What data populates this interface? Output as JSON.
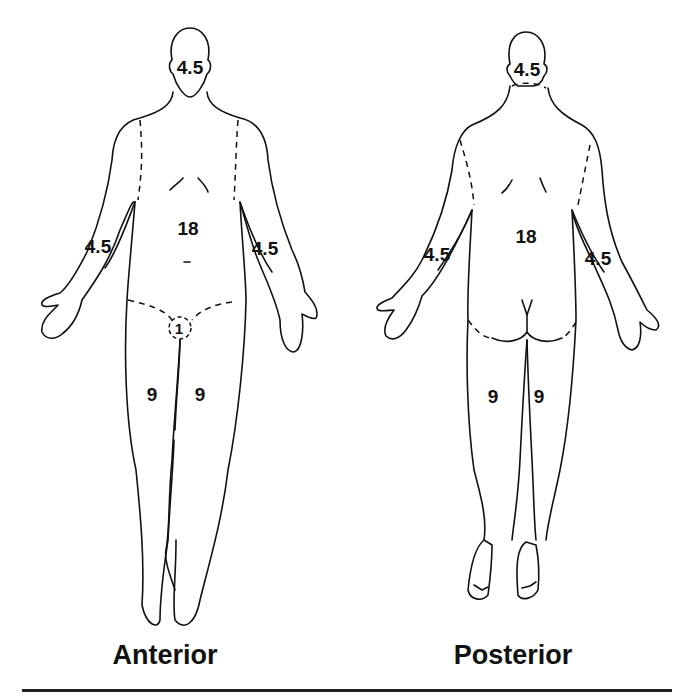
{
  "figure": {
    "views": [
      {
        "id": "anterior",
        "caption": "Anterior",
        "regions": {
          "head": "4.5",
          "trunk": "18",
          "right_arm": "4.5",
          "left_arm": "4.5",
          "genitalia": "1",
          "right_leg": "9",
          "left_leg": "9"
        }
      },
      {
        "id": "posterior",
        "caption": "Posterior",
        "regions": {
          "head": "4.5",
          "trunk": "18",
          "left_arm": "4.5",
          "right_arm": "4.5",
          "left_leg": "9",
          "right_leg": "9"
        }
      }
    ],
    "colors": {
      "line": "#111111",
      "background": "#ffffff"
    }
  }
}
